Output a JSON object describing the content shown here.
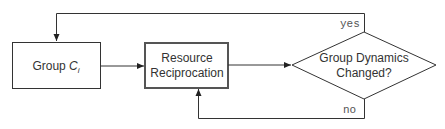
{
  "nodes": {
    "group": {
      "label": "Group ",
      "var": "C",
      "sub": "i"
    },
    "resource": {
      "line1": "Resource",
      "line2": "Reciprocation"
    },
    "decision": {
      "line1": "Group Dynamics",
      "line2": "Changed?"
    }
  },
  "edges": {
    "yes_label": "yes",
    "no_label": "no"
  },
  "colors": {
    "stroke": "#333333",
    "resource_border": "#555555"
  }
}
